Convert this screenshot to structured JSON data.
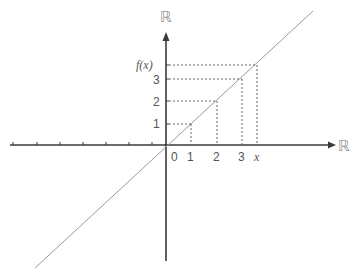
{
  "diagram": {
    "axes": {
      "x_axis_label": "ℝ",
      "y_axis_label": "ℝ",
      "origin_label": "0"
    },
    "x_ticks": [
      "1",
      "2",
      "3",
      "x"
    ],
    "y_ticks": [
      "1",
      "2",
      "3",
      "f(x)"
    ],
    "function_line": "y = x",
    "colors": {
      "axis": "#3a3a3a",
      "line": "#9a9a9a",
      "dashed": "#555555",
      "text": "#555555"
    }
  }
}
